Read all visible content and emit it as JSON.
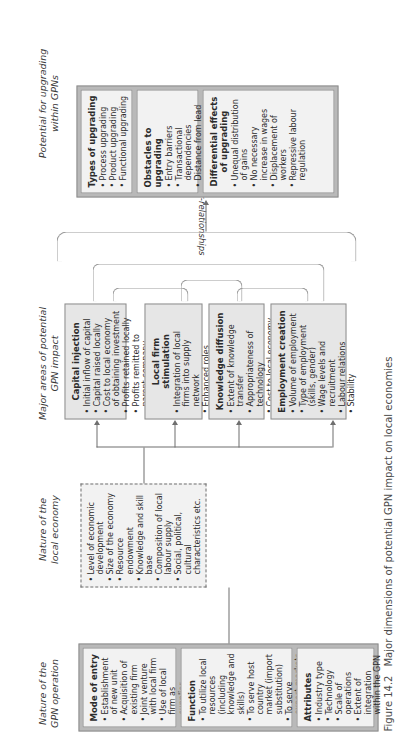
{
  "figure": {
    "number": "Figure 14.2",
    "caption": "Major dimensions of potential GPN impact on local economies"
  },
  "column_headings": {
    "gpn_operation": "Nature of the\nGPN operation",
    "local_economy": "Nature of the\nlocal economy",
    "impact_areas": "Major areas of potential\nGPN impact",
    "upgrading": "Potential for upgrading\nwithin GPNs"
  },
  "connector_label": "inter-relationships",
  "gpn_operation": {
    "panels": [
      {
        "title": "Mode of entry",
        "items": [
          "Establishment of new unit",
          "Acquisition of existing firm",
          "Joint venture with local firm",
          "Use of local firm as supplier"
        ]
      },
      {
        "title": "Function",
        "items": [
          "To utilize local resources (including knowledge and skills)",
          "To serve host country market (import substitution)",
          "To serve export markets (export platform)"
        ]
      },
      {
        "title": "Attributes",
        "items": [
          "Industry type",
          "Technology",
          "Scale of operations",
          "Extent of integration within the GPN"
        ]
      }
    ]
  },
  "local_economy": {
    "items": [
      "Level of economic development",
      "Size of the economy",
      "Resource endowment",
      "Knowledge and skill base",
      "Composition of local labour supply",
      "Social, political, cultural characteristics etc."
    ]
  },
  "impact_areas": {
    "panels": [
      {
        "title": "Capital injection",
        "items": [
          "Initial inflow of capital",
          "Capital raised locally",
          "Cost to local economy of obtaining investment",
          "Profits retained locally",
          "Profits remitted to parent company",
          "Transfer pricing",
          "Export/import balance"
        ]
      },
      {
        "title": "Local firm stimulation",
        "items": [
          "Integration of local firms into supply network",
          "Enhanced roles",
          "Spin-off effects"
        ]
      },
      {
        "title": "Knowledge diffusion",
        "items": [
          "Extent of knowledge transfer",
          "Appropriateness of technology",
          "Cost to local economy"
        ]
      },
      {
        "title": "Employment creation",
        "items": [
          "Volume of employment",
          "Type of employment (skills, gender)",
          "Wage levels and recruitment",
          "Labour relations",
          "Stability"
        ]
      }
    ]
  },
  "upgrading": {
    "panels": [
      {
        "title": "Types of upgrading",
        "items": [
          "Process upgrading",
          "Product upgrading",
          "Functional upgrading"
        ]
      },
      {
        "title": "Obstacles to upgrading",
        "items": [
          "Entry barriers",
          "Transactional dependencies",
          "Distance from lead firms"
        ]
      },
      {
        "title": "Differential effects of upgrading",
        "items": [
          "Unequal distribution of gains",
          "No necessary increase in wages",
          "Displacement of workers",
          "Repressive labour regulation"
        ]
      }
    ]
  },
  "colors": {
    "frame": "#b9b9b9",
    "panel": "#f2f2f2",
    "line": "#6f6f6f",
    "text": "#2b2b2b"
  }
}
